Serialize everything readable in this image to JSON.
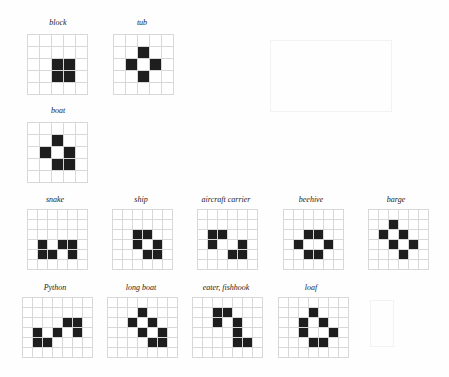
{
  "colors": {
    "alive": "#1e1e1e",
    "dead": "#ffffff",
    "grid": "#d8d8d8"
  },
  "patterns": [
    {
      "name": "block",
      "label_x": 58,
      "label_y": 18,
      "x": 27,
      "y": 34,
      "cols": 5,
      "rows": 5,
      "cell": 12,
      "alive": [
        [
          2,
          2
        ],
        [
          2,
          3
        ],
        [
          3,
          2
        ],
        [
          3,
          3
        ]
      ]
    },
    {
      "name": "tub",
      "label_x": 142,
      "label_y": 18,
      "x": 113,
      "y": 34,
      "cols": 5,
      "rows": 5,
      "cell": 12,
      "alive": [
        [
          1,
          2
        ],
        [
          2,
          1
        ],
        [
          2,
          3
        ],
        [
          3,
          2
        ]
      ]
    },
    {
      "name": "boat",
      "label_x": 58,
      "label_y": 106,
      "x": 27,
      "y": 122,
      "cols": 5,
      "rows": 5,
      "cell": 12,
      "alive": [
        [
          1,
          2
        ],
        [
          2,
          1
        ],
        [
          2,
          3
        ],
        [
          3,
          2
        ],
        [
          3,
          3
        ]
      ]
    },
    {
      "name": "snake",
      "label_x": 55,
      "label_y": 195,
      "x": 27,
      "y": 209,
      "cols": 6,
      "rows": 6,
      "cell": 10,
      "alive": [
        [
          3,
          1
        ],
        [
          3,
          3
        ],
        [
          3,
          4
        ],
        [
          4,
          1
        ],
        [
          4,
          2
        ],
        [
          4,
          4
        ]
      ]
    },
    {
      "name": "ship",
      "label_x": 141,
      "label_y": 195,
      "x": 112,
      "y": 209,
      "cols": 6,
      "rows": 6,
      "cell": 10,
      "alive": [
        [
          2,
          2
        ],
        [
          2,
          3
        ],
        [
          3,
          2
        ],
        [
          3,
          4
        ],
        [
          4,
          3
        ],
        [
          4,
          4
        ]
      ]
    },
    {
      "name": "aircraft carrier",
      "label_x": 226,
      "label_y": 195,
      "x": 197,
      "y": 209,
      "cols": 6,
      "rows": 6,
      "cell": 10,
      "alive": [
        [
          2,
          1
        ],
        [
          2,
          2
        ],
        [
          3,
          1
        ],
        [
          3,
          4
        ],
        [
          4,
          3
        ],
        [
          4,
          4
        ]
      ]
    },
    {
      "name": "beehive",
      "label_x": 311,
      "label_y": 195,
      "x": 283,
      "y": 209,
      "cols": 6,
      "rows": 6,
      "cell": 10,
      "alive": [
        [
          2,
          2
        ],
        [
          2,
          3
        ],
        [
          3,
          1
        ],
        [
          3,
          4
        ],
        [
          4,
          2
        ],
        [
          4,
          3
        ]
      ]
    },
    {
      "name": "barge",
      "label_x": 396,
      "label_y": 195,
      "x": 368,
      "y": 209,
      "cols": 6,
      "rows": 6,
      "cell": 10,
      "alive": [
        [
          1,
          2
        ],
        [
          2,
          1
        ],
        [
          2,
          3
        ],
        [
          3,
          2
        ],
        [
          3,
          4
        ],
        [
          4,
          3
        ]
      ]
    },
    {
      "name": "Python",
      "label_x": 55,
      "label_y": 283,
      "x": 22,
      "y": 297,
      "cols": 7,
      "rows": 6,
      "cell": 10,
      "alive": [
        [
          2,
          4
        ],
        [
          2,
          5
        ],
        [
          3,
          1
        ],
        [
          3,
          3
        ],
        [
          3,
          5
        ],
        [
          4,
          1
        ],
        [
          4,
          2
        ]
      ]
    },
    {
      "name": "long boat",
      "label_x": 141,
      "label_y": 283,
      "x": 107,
      "y": 297,
      "cols": 7,
      "rows": 6,
      "cell": 10,
      "alive": [
        [
          1,
          3
        ],
        [
          2,
          2
        ],
        [
          2,
          4
        ],
        [
          3,
          3
        ],
        [
          3,
          5
        ],
        [
          4,
          4
        ],
        [
          4,
          5
        ]
      ]
    },
    {
      "name": "eater, fishhook",
      "label_x": 226,
      "label_y": 283,
      "x": 192,
      "y": 297,
      "cols": 7,
      "rows": 6,
      "cell": 10,
      "alive": [
        [
          1,
          2
        ],
        [
          1,
          3
        ],
        [
          2,
          2
        ],
        [
          2,
          4
        ],
        [
          3,
          4
        ],
        [
          4,
          4
        ],
        [
          4,
          5
        ]
      ]
    },
    {
      "name": "loaf",
      "label_x": 311,
      "label_y": 283,
      "x": 278,
      "y": 297,
      "cols": 7,
      "rows": 6,
      "cell": 10,
      "alive": [
        [
          1,
          3
        ],
        [
          2,
          2
        ],
        [
          2,
          4
        ],
        [
          3,
          2
        ],
        [
          3,
          5
        ],
        [
          4,
          3
        ],
        [
          4,
          4
        ]
      ]
    }
  ]
}
